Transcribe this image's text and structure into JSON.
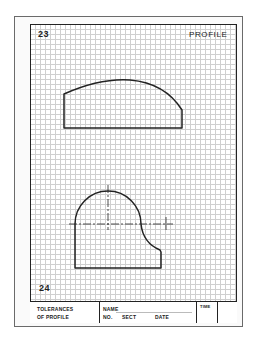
{
  "worksheet": {
    "top_left_number": "23",
    "top_right_title": "PROFILE",
    "bottom_left_number": "24",
    "grid": {
      "spacing_px": 5,
      "color": "#cfcfcf"
    },
    "figures": [
      {
        "id": "upper",
        "description": "Profile shape: rectangle with arched top, right side lower"
      },
      {
        "id": "lower",
        "description": "Profile shape: semicircle over rectangle with concave fillet on right, with center lines"
      }
    ],
    "line_color": "#222222"
  },
  "title_block": {
    "left_line1": "TOLERANCES",
    "left_line2": "OF PROFILE",
    "name_label": "NAME",
    "no_label": "NO.",
    "sect_label": "SECT",
    "date_label": "DATE",
    "time_label": "TIME"
  }
}
